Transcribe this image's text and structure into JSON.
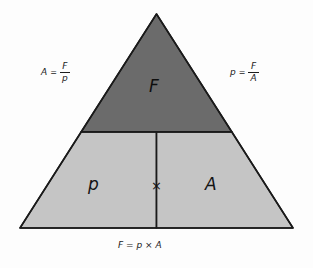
{
  "diagram": {
    "colors": {
      "background": "#fdfdfd",
      "top_region_fill": "#6b6b6b",
      "bottom_region_fill": "#c5c5c5",
      "outline": "#1a1a1a",
      "text": "#141414"
    },
    "regions": {
      "top": {
        "label": "F",
        "name": "force"
      },
      "bottom_left": {
        "label": "p",
        "name": "pressure"
      },
      "bottom_right": {
        "label": "A",
        "name": "area"
      },
      "operator": {
        "label": "×",
        "name": "multiplication"
      }
    },
    "formulas": {
      "left": {
        "lhs": "A",
        "equals": "=",
        "numerator": "F",
        "denominator": "p"
      },
      "right": {
        "lhs": "p",
        "equals": "=",
        "numerator": "F",
        "denominator": "A"
      },
      "bottom": {
        "text": "F = p × A"
      }
    }
  }
}
